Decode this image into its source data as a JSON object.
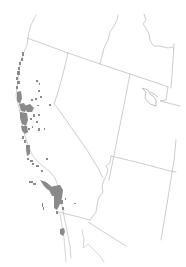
{
  "map": {
    "type": "species range map",
    "width": 186,
    "height": 267,
    "background": "#ffffff",
    "colors": {
      "border": "#b8b8b8",
      "coast": "#c4c4c4",
      "range_fill": "#8a8a8a",
      "lake": "#b0b0b0"
    },
    "regions": [
      {
        "name": "Oregon (southern)",
        "id": "oregon"
      },
      {
        "name": "Idaho (southern)",
        "id": "idaho"
      },
      {
        "name": "Nevada",
        "id": "nevada"
      },
      {
        "name": "Utah",
        "id": "utah"
      },
      {
        "name": "California",
        "id": "california"
      },
      {
        "name": "Arizona",
        "id": "arizona"
      },
      {
        "name": "Wyoming (edge)",
        "id": "wyoming"
      }
    ],
    "features": [
      {
        "name": "Great Salt Lake",
        "id": "great-salt-lake"
      }
    ],
    "range_description": "Gray patches along the California coast ranges from the Oregon border south to Southern California"
  }
}
